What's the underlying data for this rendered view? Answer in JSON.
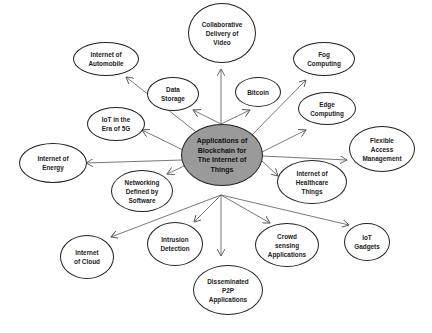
{
  "diagram": {
    "center": {
      "label": "Applications of Blockchain for The Internet of Things",
      "lines": [
        "Applications of",
        "Blockchain for",
        "The Internet of",
        "Things"
      ],
      "fill": "#9a9a9a"
    },
    "nodes": [
      {
        "id": "collaborative-delivery-of-video",
        "lines": [
          "Collaborative",
          "Delivery of",
          "Video"
        ]
      },
      {
        "id": "internet-of-automobile",
        "lines": [
          "Internet of",
          "Automobile"
        ]
      },
      {
        "id": "data-storage",
        "lines": [
          "Data",
          "Storage"
        ]
      },
      {
        "id": "bitcoin",
        "lines": [
          "Bitcoin"
        ]
      },
      {
        "id": "fog-computing",
        "lines": [
          "Fog",
          "Computing"
        ]
      },
      {
        "id": "edge-computing",
        "lines": [
          "Edge",
          "Computing"
        ]
      },
      {
        "id": "iot-in-the-era-of-5g",
        "lines": [
          "IoT in the",
          "Era of 5G"
        ]
      },
      {
        "id": "flexible-access-management",
        "lines": [
          "Flexible",
          "Access",
          "Management"
        ]
      },
      {
        "id": "internet-of-energy",
        "lines": [
          "Internet of",
          "Energy"
        ]
      },
      {
        "id": "internet-of-healthcare-things",
        "lines": [
          "Internet of",
          "Healthcare",
          "Things"
        ]
      },
      {
        "id": "networking-defined-by-software",
        "lines": [
          "Networking",
          "Defined by",
          "Software"
        ]
      },
      {
        "id": "internet-of-cloud",
        "lines": [
          "Internet",
          "of Cloud"
        ]
      },
      {
        "id": "intrusion-detection",
        "lines": [
          "Intrusion",
          "Detection"
        ]
      },
      {
        "id": "crowd-sensing-applications",
        "lines": [
          "Crowd",
          "sensing",
          "Applications"
        ]
      },
      {
        "id": "iot-gadgets",
        "lines": [
          "IoT",
          "Gadgets"
        ]
      },
      {
        "id": "disseminated-p2p-applications",
        "lines": [
          "Disseminated",
          "P2P",
          "Applications"
        ]
      }
    ],
    "edge_color": "#555555",
    "border_color": "#222222"
  }
}
